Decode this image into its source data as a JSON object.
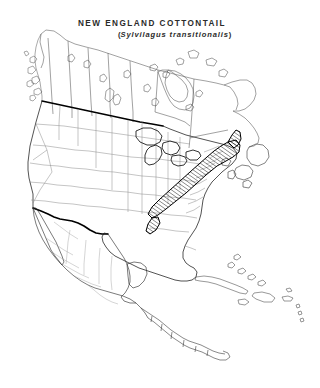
{
  "figure": {
    "common_name": "NEW  ENGLAND  COTTONTAIL",
    "scientific_name": "Sylvilagus  transitionalis",
    "open_paren": "(",
    "close_paren": ")",
    "background_color": "#ffffff",
    "coastline_color": "#000000",
    "internal_border_color": "#7a7a7a",
    "national_border_color": "#000000",
    "range_hatch_color": "#000000"
  },
  "map": {
    "projection_region": "North America",
    "features": [
      {
        "name": "canada",
        "label": "Canada"
      },
      {
        "name": "united-states",
        "label": "United States"
      },
      {
        "name": "mexico",
        "label": "Mexico"
      },
      {
        "name": "central-america",
        "label": "Central America"
      },
      {
        "name": "caribbean-islands",
        "label": "Caribbean Islands"
      },
      {
        "name": "great-lakes",
        "label": "Great Lakes"
      },
      {
        "name": "newfoundland",
        "label": "Newfoundland"
      },
      {
        "name": "baja-california",
        "label": "Baja California"
      },
      {
        "name": "alaska-panhandle",
        "label": "Alaska Panhandle"
      },
      {
        "name": "hudson-bay",
        "label": "Hudson Bay"
      }
    ],
    "range_polygon": {
      "name": "new-england-cottontail-range",
      "fill_style": "diagonal-hatch",
      "hatch_angle_degrees": 55,
      "hatch_spacing_px": 2.6,
      "description": "Hatched distribution band from Maine and the Maritimes southwest through New England and the Appalachian Mountains to northern Alabama"
    }
  }
}
